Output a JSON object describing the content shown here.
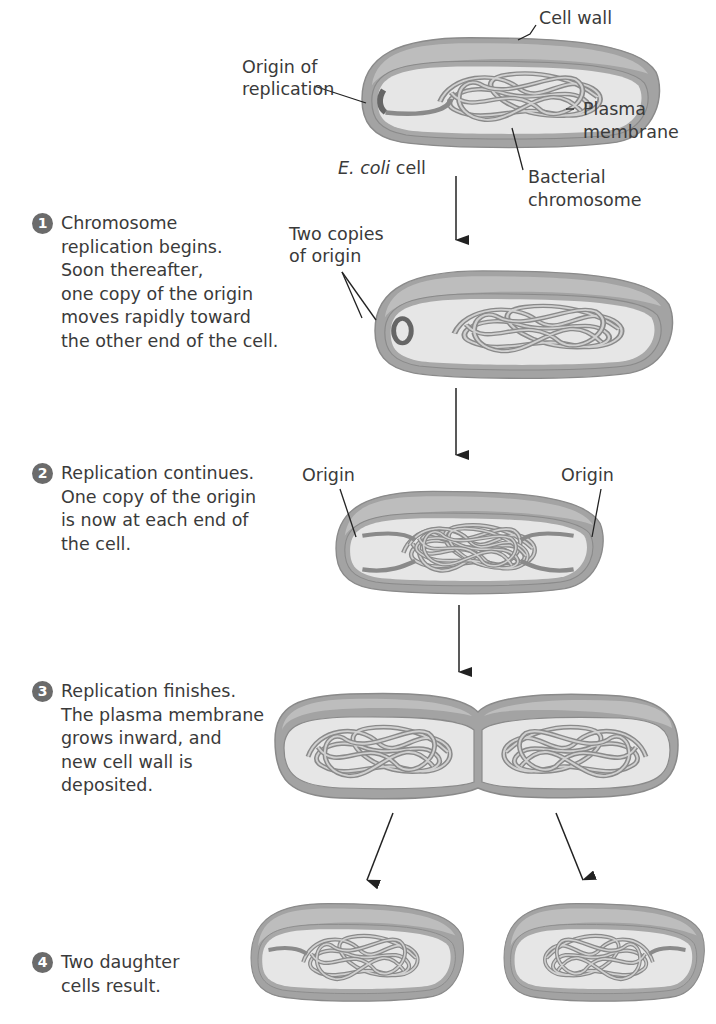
{
  "labels": {
    "origin_of_replication": [
      "Origin of",
      "replication"
    ],
    "cell_wall": "Cell wall",
    "plasma_membrane": [
      "Plasma",
      "membrane"
    ],
    "ecoli_italic": "E. coli",
    "ecoli_rest": " cell",
    "bacterial_chromosome": [
      "Bacterial",
      "chromosome"
    ],
    "two_copies_of_origin": [
      "Two copies",
      "of origin"
    ],
    "origin_left": "Origin",
    "origin_right": "Origin"
  },
  "steps": [
    {
      "number": "1",
      "lines": [
        "Chromosome",
        "replication begins.",
        "Soon thereafter,",
        "one copy of the origin",
        "moves rapidly toward",
        "the other end of the cell."
      ]
    },
    {
      "number": "2",
      "lines": [
        "Replication continues.",
        "One copy of the origin",
        "is now at each end of",
        "the cell."
      ]
    },
    {
      "number": "3",
      "lines": [
        "Replication finishes.",
        "The plasma membrane",
        "grows inward, and",
        "new cell wall is",
        "deposited."
      ]
    },
    {
      "number": "4",
      "lines": [
        "Two daughter",
        "cells result."
      ]
    }
  ],
  "colors": {
    "wall": "#9a9a9a",
    "wall_top": "#b5b5b5",
    "cytoplasm": "#e6e6e6",
    "chromosome": "#8a8a8a",
    "step_badge": "#6b6b6b",
    "text": "#3a3a3a"
  }
}
